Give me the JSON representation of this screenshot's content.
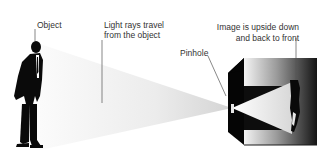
{
  "labels": {
    "object": "Object",
    "light_rays_line1": "Light rays travel",
    "light_rays_line2": "from the object",
    "pinhole": "Pinhole",
    "image_line1": "Image is upside down",
    "image_line2": "and back to front"
  },
  "colors": {
    "background": "#ffffff",
    "silhouette": "#0a0a0a",
    "beam_light": "#d9d9d9",
    "beam_faint": "#f4f4f4",
    "box_dark": "#050505",
    "box_face_light": "#f2f2f2",
    "box_face_dark": "#1a1a1a",
    "leader_line": "#555555",
    "text": "#333333"
  }
}
